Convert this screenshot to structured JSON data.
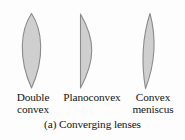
{
  "figure": {
    "caption": "(a) Converging lenses",
    "background_color": "#fdfdfd",
    "text_color": "#141414"
  },
  "lenses": [
    {
      "name": "double-convex",
      "label_line1": "Double",
      "label_line2": "convex",
      "shape": "biconvex",
      "fill_color": "#cfcfcf",
      "stroke_color": "#8a8a8a"
    },
    {
      "name": "planoconvex",
      "label_line1": "Planoconvex",
      "label_line2": "",
      "shape": "plano-convex",
      "fill_color": "#cfcfcf",
      "stroke_color": "#8a8a8a"
    },
    {
      "name": "convex-meniscus",
      "label_line1": "Convex",
      "label_line2": "meniscus",
      "shape": "meniscus",
      "fill_color": "#cfcfcf",
      "stroke_color": "#8a8a8a"
    }
  ]
}
